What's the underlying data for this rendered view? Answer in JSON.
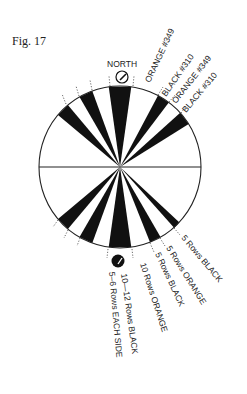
{
  "figure": {
    "label": "Fig. 17"
  },
  "diagram": {
    "type": "sector-wheel",
    "north_label": "NORTH",
    "top_labels": [
      "ORANGE #349",
      "BLACK #310",
      "ORANGE #349",
      "BLACK #310"
    ],
    "bottom_labels": [
      "5 Rows BLACK",
      "5 Rows ORANGE",
      "5 Rows BLACK",
      "10 Rows ORANGE",
      "10—12 Rows BLACK",
      "5–6 Rows EACH SIDE"
    ],
    "colors": {
      "ink": "#111111",
      "background": "#ffffff"
    }
  }
}
